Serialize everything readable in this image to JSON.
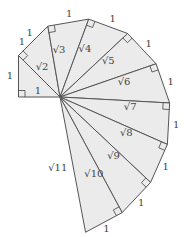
{
  "diagram": {
    "triangle_count": 10,
    "colors": {
      "fill": "#ebebeb",
      "stroke": "#555555",
      "text": "#444444"
    },
    "hypotenuse_labels": [
      "√2",
      "√3",
      "√4",
      "√5",
      "√6",
      "√7",
      "√8",
      "√9",
      "√10",
      "√11"
    ],
    "initial_leg_label": "1",
    "initial_side_label": "1",
    "outer_edge_labels": [
      "1",
      "1",
      "1",
      "1",
      "1",
      "1",
      "1",
      "1",
      "1",
      "1"
    ]
  }
}
